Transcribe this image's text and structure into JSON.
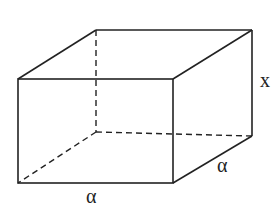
{
  "diagram": {
    "type": "rectangular-box",
    "labels": {
      "height": "x",
      "depth": "α",
      "width": "α"
    },
    "colors": {
      "stroke": "#222222",
      "background": "#ffffff"
    }
  }
}
